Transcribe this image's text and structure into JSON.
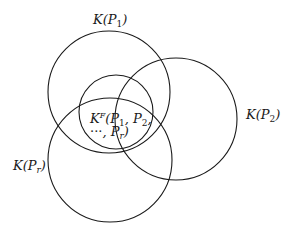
{
  "diagram": {
    "type": "venn",
    "stroke_color": "#1a1a1a",
    "background": "#ffffff",
    "circles": [
      {
        "id": "K_P1",
        "cx": 109,
        "cy": 92,
        "r": 61
      },
      {
        "id": "K_P2",
        "cx": 176,
        "cy": 119,
        "r": 61
      },
      {
        "id": "K_Pr",
        "cx": 110,
        "cy": 160,
        "r": 62
      },
      {
        "id": "K_F",
        "cx": 116,
        "cy": 112,
        "r": 37
      }
    ],
    "labels": {
      "k_p1": {
        "base": "K(",
        "var": "P",
        "sub": "1",
        "close": ")"
      },
      "k_p2": {
        "base": "K(",
        "var": "P",
        "sub": "2",
        "close": ")"
      },
      "k_pr": {
        "base": "K(",
        "var": "P",
        "sub": "r",
        "close": ")"
      },
      "k_f": {
        "line1": {
          "base": "K",
          "sup": "F",
          "open": "(",
          "p1": "P",
          "p1_sub": "1",
          "sep1": ", ",
          "p2": "P",
          "p2_sub": "2",
          "sep2": ","
        },
        "line2": {
          "dots": "···",
          "sep": ", ",
          "pr": "P",
          "pr_sub": "r",
          "close": ")"
        }
      }
    }
  }
}
